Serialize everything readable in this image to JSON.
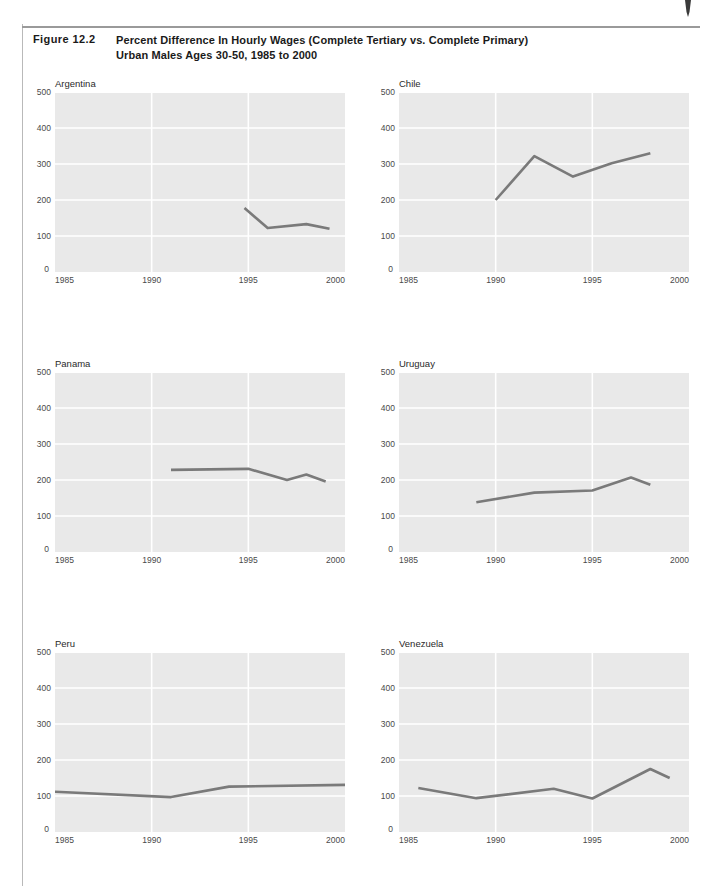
{
  "figure": {
    "label": "Figure 12.2",
    "title_line1": "Percent Difference In Hourly Wages (Complete Tertiary vs. Complete Primary)",
    "title_line2": "Urban Males Ages 30-50, 1985 to 2000"
  },
  "style": {
    "plot_background": "#e9e9e9",
    "gridline_color": "#ffffff",
    "line_color": "#7a7a7a",
    "tick_text_color": "#4a4a4a",
    "rule_color": "#9a9a9a"
  },
  "axes": {
    "y_ticks": [
      "500",
      "400",
      "300",
      "200",
      "100",
      "0"
    ],
    "y_values": [
      500,
      400,
      300,
      200,
      100,
      0
    ],
    "x_ticks": [
      "1985",
      "1990",
      "1995",
      "2000"
    ],
    "x_values": [
      1985,
      1990,
      1995,
      2000
    ],
    "xlim": [
      1985,
      2000
    ],
    "ylim": [
      0,
      500
    ]
  },
  "chart_data": [
    {
      "type": "line",
      "title": "Argentina",
      "xlabel": "",
      "ylabel": "",
      "xlim": [
        1985,
        2000
      ],
      "ylim": [
        0,
        500
      ],
      "grid": true,
      "legend": "none",
      "x": [
        1994.8,
        1996.0,
        1998.0,
        1999.2
      ],
      "values": [
        178,
        122,
        133,
        120
      ]
    },
    {
      "type": "line",
      "title": "Chile",
      "xlabel": "",
      "ylabel": "",
      "xlim": [
        1985,
        2000
      ],
      "ylim": [
        0,
        500
      ],
      "grid": true,
      "legend": "none",
      "x": [
        1990,
        1992,
        1994,
        1996,
        1998
      ],
      "values": [
        200,
        322,
        265,
        302,
        330
      ]
    },
    {
      "type": "line",
      "title": "Panama",
      "xlabel": "",
      "ylabel": "",
      "xlim": [
        1985,
        2000
      ],
      "ylim": [
        0,
        500
      ],
      "grid": true,
      "legend": "none",
      "x": [
        1991,
        1995,
        1997,
        1998,
        1999
      ],
      "values": [
        228,
        231,
        200,
        215,
        196
      ]
    },
    {
      "type": "line",
      "title": "Uruguay",
      "xlabel": "",
      "ylabel": "",
      "xlim": [
        1985,
        2000
      ],
      "ylim": [
        0,
        500
      ],
      "grid": true,
      "legend": "none",
      "x": [
        1989,
        1992,
        1995,
        1997,
        1998
      ],
      "values": [
        138,
        165,
        171,
        207,
        187
      ]
    },
    {
      "type": "line",
      "title": "Peru",
      "xlabel": "",
      "ylabel": "",
      "xlim": [
        1985,
        2000
      ],
      "ylim": [
        0,
        500
      ],
      "grid": true,
      "legend": "none",
      "x": [
        1985,
        1991,
        1994,
        2000
      ],
      "values": [
        112,
        97,
        126,
        131
      ]
    },
    {
      "type": "line",
      "title": "Venezuela",
      "xlabel": "",
      "ylabel": "",
      "xlim": [
        1985,
        2000
      ],
      "ylim": [
        0,
        500
      ],
      "grid": true,
      "legend": "none",
      "x": [
        1986,
        1989,
        1993,
        1995,
        1998,
        1999
      ],
      "values": [
        122,
        94,
        120,
        93,
        175,
        150
      ]
    }
  ]
}
